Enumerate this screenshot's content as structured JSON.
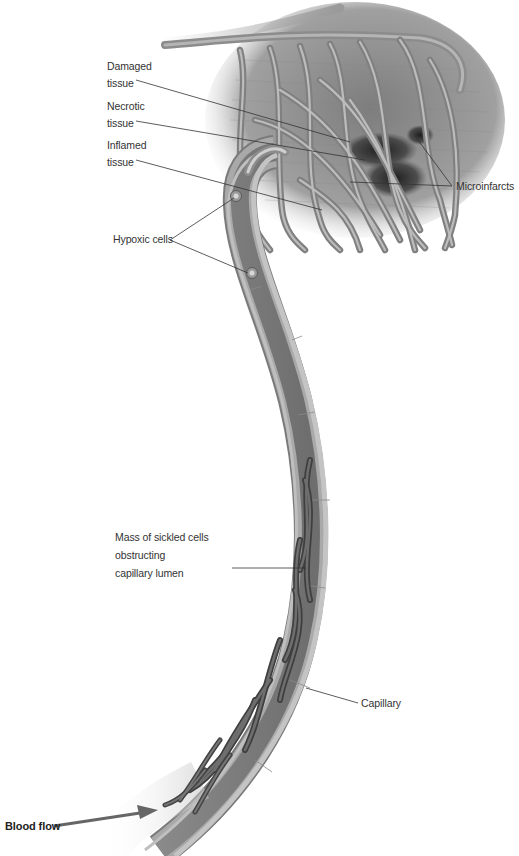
{
  "diagram": {
    "type": "medical-illustration",
    "colors": {
      "background": "#ffffff",
      "vessel_wall": "#a8a8a8",
      "vessel_wall_dark": "#7a7a7a",
      "vessel_lumen": "#8c8c8c",
      "tissue": "#9a9a9a",
      "infarct": "#2a2a2a",
      "sickled_cells": "#555555",
      "leader_line": "#333333",
      "arrow": "#666666",
      "label_text": "#333333"
    },
    "labels": {
      "damaged_tissue": [
        "Damaged",
        "tissue"
      ],
      "necrotic_tissue": [
        "Necrotic",
        "tissue"
      ],
      "inflamed_tissue": [
        "Inflamed",
        "tissue"
      ],
      "microinfarcts": "Microinfarcts",
      "hypoxic_cells": "Hypoxic cells",
      "sickled_mass": [
        "Mass of sickled cells",
        "obstructing",
        "capillary lumen"
      ],
      "capillary": "Capillary",
      "blood_flow": "Blood flow"
    }
  }
}
